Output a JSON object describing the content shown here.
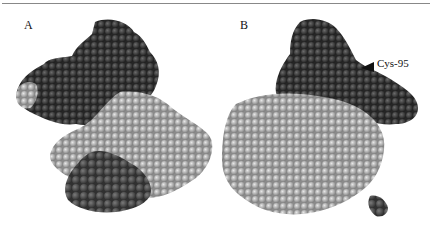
{
  "figure": {
    "panels": [
      {
        "label": "A",
        "description": "space-filling protein model, dark and light subunits"
      },
      {
        "label": "B",
        "description": "space-filling protein model, rotated view"
      }
    ],
    "annotation": {
      "text": "Cys-95",
      "marker": "arrowhead-left"
    },
    "colors": {
      "dark_subunit": "#3a3a3a",
      "medium_subunit": "#555555",
      "light_subunit": "#b5b5b5",
      "rule": "#888888"
    }
  }
}
